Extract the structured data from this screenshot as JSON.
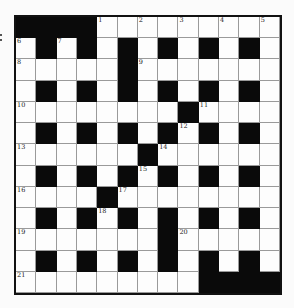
{
  "puzzle": {
    "rows": 13,
    "cols": 13,
    "layout": [
      "####.........",
      ".#.#.#.#.#.#.",
      ".....#.......",
      ".#.#.#.#.#.#.",
      "........#....",
      ".#.#.#.#.#.#.",
      "......#......",
      ".#.#.#.#.#.#.",
      "....#........",
      ".#.#.#.#.#.#.",
      ".......#.....",
      ".#.#.#.#.#.#.",
      ".........####"
    ],
    "numbers": [
      {
        "row": 0,
        "col": 4,
        "n": "1"
      },
      {
        "row": 0,
        "col": 6,
        "n": "2"
      },
      {
        "row": 0,
        "col": 8,
        "n": "3"
      },
      {
        "row": 0,
        "col": 10,
        "n": "4"
      },
      {
        "row": 0,
        "col": 12,
        "n": "5"
      },
      {
        "row": 1,
        "col": 0,
        "n": "6"
      },
      {
        "row": 1,
        "col": 2,
        "n": "7"
      },
      {
        "row": 2,
        "col": 0,
        "n": "8"
      },
      {
        "row": 2,
        "col": 6,
        "n": "9"
      },
      {
        "row": 4,
        "col": 0,
        "n": "10"
      },
      {
        "row": 4,
        "col": 9,
        "n": "11"
      },
      {
        "row": 5,
        "col": 8,
        "n": "12"
      },
      {
        "row": 6,
        "col": 0,
        "n": "13"
      },
      {
        "row": 6,
        "col": 7,
        "n": "14"
      },
      {
        "row": 7,
        "col": 6,
        "n": "15"
      },
      {
        "row": 8,
        "col": 0,
        "n": "16"
      },
      {
        "row": 8,
        "col": 5,
        "n": "17"
      },
      {
        "row": 9,
        "col": 4,
        "n": "18"
      },
      {
        "row": 10,
        "col": 0,
        "n": "19"
      },
      {
        "row": 10,
        "col": 8,
        "n": "20"
      },
      {
        "row": 12,
        "col": 0,
        "n": "21"
      }
    ],
    "colors": {
      "block": "#0a0a0a",
      "cell": "#fdfdfd",
      "gridline": "#9a9a9a"
    }
  }
}
